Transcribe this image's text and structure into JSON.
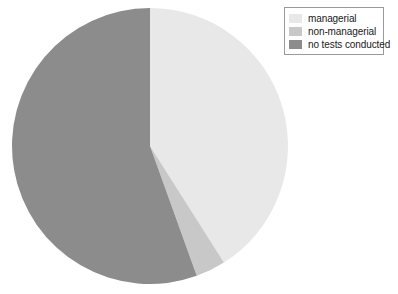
{
  "chart_data": {
    "type": "pie",
    "title": "",
    "categories": [
      "managerial",
      "non-managerial",
      "no tests conducted"
    ],
    "values": [
      41.0,
      3.5,
      55.5
    ],
    "units": "percent",
    "colors": [
      "#e8e8e8",
      "#c8c8c8",
      "#8c8c8c"
    ],
    "start_angle_deg": 0,
    "direction": "clockwise",
    "legend_position": "top-right",
    "grid": false,
    "xlabel": "",
    "ylabel": "",
    "slices": [
      {
        "label": "managerial",
        "value": 41.0,
        "color": "#e8e8e8",
        "start_deg": 0,
        "end_deg": 147.6
      },
      {
        "label": "non-managerial",
        "value": 3.5,
        "color": "#c8c8c8",
        "start_deg": 147.6,
        "end_deg": 160.2
      },
      {
        "label": "no tests conducted",
        "value": 55.5,
        "color": "#8c8c8c",
        "start_deg": 160.2,
        "end_deg": 360
      }
    ]
  },
  "legend": {
    "entries": [
      {
        "label": "managerial",
        "color": "#e8e8e8",
        "swatch_name": "legend-swatch-managerial"
      },
      {
        "label": "non-managerial",
        "color": "#c8c8c8",
        "swatch_name": "legend-swatch-non-managerial"
      },
      {
        "label": "no tests conducted",
        "color": "#8c8c8c",
        "swatch_name": "legend-swatch-no-tests-conducted"
      }
    ],
    "border_color": "#9a9a9a",
    "background_color": "#ffffff"
  },
  "pie": {
    "center_x": 150,
    "center_y": 146,
    "radius": 138,
    "background_color": "#ffffff"
  }
}
